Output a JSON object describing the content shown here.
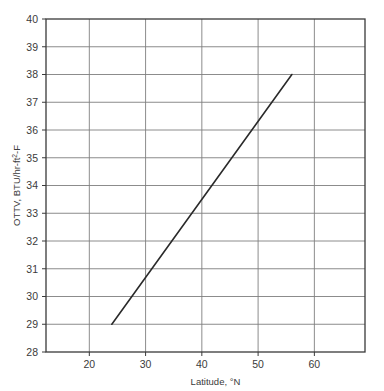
{
  "chart_data": {
    "type": "line",
    "title": "",
    "xlabel": "Latitude, °N",
    "ylabel": "OTTV, BTU/hr-ft²-F",
    "ylabel_parts": {
      "prefix": "OTTV, BTU/hr-ft",
      "superscript": "2",
      "suffix": "-F"
    },
    "xlabel_parts": {
      "prefix": "Latitude, ",
      "degree": "°",
      "suffix": "N"
    },
    "xlim": [
      12.3,
      69.0
    ],
    "ylim": [
      28,
      40
    ],
    "xticks": [
      20,
      30,
      40,
      50,
      60
    ],
    "xtick_labels": [
      "20",
      "30",
      "40",
      "50",
      "60"
    ],
    "yticks": [
      28,
      29,
      30,
      31,
      32,
      33,
      34,
      35,
      36,
      37,
      38,
      39,
      40
    ],
    "ytick_labels": [
      "28",
      "29",
      "30",
      "31",
      "32",
      "33",
      "34",
      "35",
      "36",
      "37",
      "38",
      "39",
      "40"
    ],
    "grid": true,
    "grid_x": true,
    "grid_y": true,
    "legend": false,
    "legend_position": "none",
    "series": [
      {
        "name": "OTTV vs Latitude",
        "x": [
          24,
          56
        ],
        "y": [
          29,
          38
        ],
        "points": [
          {
            "x": 24,
            "y": 29
          },
          {
            "x": 56,
            "y": 38
          }
        ],
        "slope_per_degree": 0.281,
        "color": "#2a2a2a",
        "linewidth": 1.6,
        "marker": "none"
      }
    ],
    "colors": {
      "line": "#2a2a2a",
      "grid": "#7f7f7f",
      "axis": "#3a3a3a",
      "text": "#3b3b3b",
      "background": "#ffffff"
    },
    "annotations": []
  },
  "geometry": {
    "plot_left": 46,
    "plot_right": 365,
    "plot_top": 19,
    "plot_bottom": 352
  }
}
